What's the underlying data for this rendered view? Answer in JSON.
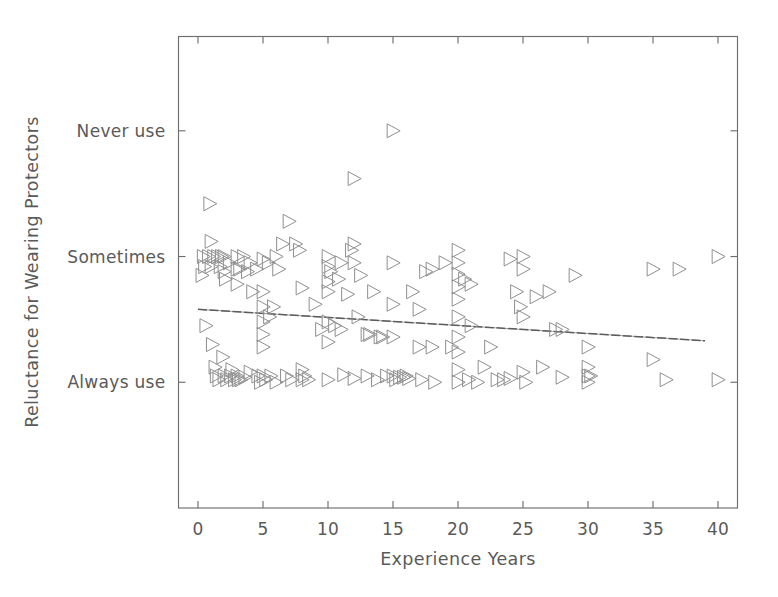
{
  "chart_data": {
    "type": "scatter",
    "title": "",
    "xlabel": "Experience Years",
    "ylabel": "Reluctance for Wearing Protectors",
    "xlim": [
      -1.5,
      41.5
    ],
    "ylim": [
      0.0,
      3.75
    ],
    "grid": false,
    "legend": null,
    "marker_style": "open right-pointing triangle",
    "marker_color": "#8f8f8f",
    "xticks": [
      0,
      5,
      10,
      15,
      20,
      25,
      30,
      35,
      40
    ],
    "xticklabels": [
      "0",
      "5",
      "10",
      "15",
      "20",
      "25",
      "30",
      "35",
      "40"
    ],
    "yticks": [
      1,
      2,
      3
    ],
    "yticklabels": [
      "Always use",
      "Sometimes",
      "Never use"
    ],
    "annotations": [
      {
        "type": "regression-line",
        "style": "dashed gray",
        "x_start": 0,
        "x_end": 39,
        "y_start": 1.58,
        "y_end": 1.33,
        "slope": -0.0064,
        "intercept": 1.58
      }
    ],
    "points": [
      {
        "x": 0.3,
        "y": 1.85
      },
      {
        "x": 0.4,
        "y": 2.0
      },
      {
        "x": 0.5,
        "y": 1.92
      },
      {
        "x": 0.6,
        "y": 1.45
      },
      {
        "x": 0.8,
        "y": 2.0
      },
      {
        "x": 0.9,
        "y": 2.42
      },
      {
        "x": 1.0,
        "y": 2.12
      },
      {
        "x": 1.0,
        "y": 1.92
      },
      {
        "x": 1.1,
        "y": 1.3
      },
      {
        "x": 1.2,
        "y": 2.0
      },
      {
        "x": 1.3,
        "y": 1.12
      },
      {
        "x": 1.4,
        "y": 1.05
      },
      {
        "x": 1.5,
        "y": 2.0
      },
      {
        "x": 1.6,
        "y": 1.02
      },
      {
        "x": 1.7,
        "y": 1.92
      },
      {
        "x": 1.8,
        "y": 2.0
      },
      {
        "x": 1.9,
        "y": 1.2
      },
      {
        "x": 2.0,
        "y": 2.0
      },
      {
        "x": 2.0,
        "y": 1.88
      },
      {
        "x": 2.0,
        "y": 1.05
      },
      {
        "x": 2.1,
        "y": 1.82
      },
      {
        "x": 2.2,
        "y": 1.02
      },
      {
        "x": 2.4,
        "y": 1.95
      },
      {
        "x": 2.5,
        "y": 1.05
      },
      {
        "x": 2.6,
        "y": 1.1
      },
      {
        "x": 2.8,
        "y": 1.02
      },
      {
        "x": 3.0,
        "y": 2.0
      },
      {
        "x": 3.0,
        "y": 1.9
      },
      {
        "x": 3.0,
        "y": 1.78
      },
      {
        "x": 3.0,
        "y": 1.05
      },
      {
        "x": 3.1,
        "y": 1.02
      },
      {
        "x": 3.2,
        "y": 1.9
      },
      {
        "x": 3.3,
        "y": 1.02
      },
      {
        "x": 3.5,
        "y": 2.0
      },
      {
        "x": 3.6,
        "y": 1.04
      },
      {
        "x": 3.8,
        "y": 1.88
      },
      {
        "x": 4.0,
        "y": 1.95
      },
      {
        "x": 4.0,
        "y": 1.08
      },
      {
        "x": 4.2,
        "y": 1.72
      },
      {
        "x": 4.5,
        "y": 1.9
      },
      {
        "x": 4.6,
        "y": 1.05
      },
      {
        "x": 4.8,
        "y": 1.0
      },
      {
        "x": 5.0,
        "y": 1.98
      },
      {
        "x": 5.0,
        "y": 1.72
      },
      {
        "x": 5.0,
        "y": 1.6
      },
      {
        "x": 5.0,
        "y": 1.48
      },
      {
        "x": 5.0,
        "y": 1.38
      },
      {
        "x": 5.0,
        "y": 1.28
      },
      {
        "x": 5.0,
        "y": 1.05
      },
      {
        "x": 5.2,
        "y": 1.02
      },
      {
        "x": 5.4,
        "y": 1.95
      },
      {
        "x": 5.5,
        "y": 1.52
      },
      {
        "x": 5.6,
        "y": 1.05
      },
      {
        "x": 5.8,
        "y": 1.6
      },
      {
        "x": 6.0,
        "y": 2.0
      },
      {
        "x": 6.0,
        "y": 1.0
      },
      {
        "x": 6.2,
        "y": 1.9
      },
      {
        "x": 6.5,
        "y": 2.1
      },
      {
        "x": 6.8,
        "y": 1.05
      },
      {
        "x": 7.0,
        "y": 2.28
      },
      {
        "x": 7.2,
        "y": 1.02
      },
      {
        "x": 7.5,
        "y": 2.1
      },
      {
        "x": 7.8,
        "y": 2.05
      },
      {
        "x": 8.0,
        "y": 1.75
      },
      {
        "x": 8.0,
        "y": 1.1
      },
      {
        "x": 8.0,
        "y": 1.02
      },
      {
        "x": 8.2,
        "y": 1.05
      },
      {
        "x": 8.5,
        "y": 1.02
      },
      {
        "x": 9.0,
        "y": 1.62
      },
      {
        "x": 9.5,
        "y": 1.42
      },
      {
        "x": 10.0,
        "y": 2.0
      },
      {
        "x": 10.0,
        "y": 1.92
      },
      {
        "x": 10.0,
        "y": 1.8
      },
      {
        "x": 10.0,
        "y": 1.72
      },
      {
        "x": 10.0,
        "y": 1.48
      },
      {
        "x": 10.0,
        "y": 1.32
      },
      {
        "x": 10.0,
        "y": 1.02
      },
      {
        "x": 10.2,
        "y": 1.88
      },
      {
        "x": 10.5,
        "y": 1.45
      },
      {
        "x": 10.8,
        "y": 1.82
      },
      {
        "x": 11.0,
        "y": 1.95
      },
      {
        "x": 11.0,
        "y": 1.42
      },
      {
        "x": 11.2,
        "y": 1.06
      },
      {
        "x": 11.5,
        "y": 1.7
      },
      {
        "x": 11.8,
        "y": 2.05
      },
      {
        "x": 12.0,
        "y": 2.62
      },
      {
        "x": 12.0,
        "y": 2.1
      },
      {
        "x": 12.0,
        "y": 1.95
      },
      {
        "x": 12.0,
        "y": 1.03
      },
      {
        "x": 12.3,
        "y": 1.52
      },
      {
        "x": 12.5,
        "y": 1.85
      },
      {
        "x": 13.0,
        "y": 1.38
      },
      {
        "x": 13.0,
        "y": 1.05
      },
      {
        "x": 13.2,
        "y": 1.38
      },
      {
        "x": 13.5,
        "y": 1.72
      },
      {
        "x": 13.8,
        "y": 1.02
      },
      {
        "x": 14.0,
        "y": 1.36
      },
      {
        "x": 14.2,
        "y": 1.36
      },
      {
        "x": 14.5,
        "y": 1.05
      },
      {
        "x": 15.0,
        "y": 3.0
      },
      {
        "x": 15.0,
        "y": 1.95
      },
      {
        "x": 15.0,
        "y": 1.62
      },
      {
        "x": 15.0,
        "y": 1.36
      },
      {
        "x": 15.0,
        "y": 1.05
      },
      {
        "x": 15.2,
        "y": 1.02
      },
      {
        "x": 15.5,
        "y": 1.04
      },
      {
        "x": 15.8,
        "y": 1.04
      },
      {
        "x": 16.0,
        "y": 1.05
      },
      {
        "x": 16.2,
        "y": 1.03
      },
      {
        "x": 16.5,
        "y": 1.72
      },
      {
        "x": 17.0,
        "y": 1.58
      },
      {
        "x": 17.0,
        "y": 1.28
      },
      {
        "x": 17.2,
        "y": 1.02
      },
      {
        "x": 17.5,
        "y": 1.88
      },
      {
        "x": 18.0,
        "y": 1.9
      },
      {
        "x": 18.0,
        "y": 1.28
      },
      {
        "x": 18.2,
        "y": 1.0
      },
      {
        "x": 19.0,
        "y": 1.95
      },
      {
        "x": 19.5,
        "y": 1.28
      },
      {
        "x": 20.0,
        "y": 2.05
      },
      {
        "x": 20.0,
        "y": 1.95
      },
      {
        "x": 20.0,
        "y": 1.86
      },
      {
        "x": 20.0,
        "y": 1.76
      },
      {
        "x": 20.0,
        "y": 1.66
      },
      {
        "x": 20.0,
        "y": 1.52
      },
      {
        "x": 20.0,
        "y": 1.36
      },
      {
        "x": 20.0,
        "y": 1.24
      },
      {
        "x": 20.0,
        "y": 1.1
      },
      {
        "x": 20.0,
        "y": 1.0
      },
      {
        "x": 20.5,
        "y": 1.82
      },
      {
        "x": 20.8,
        "y": 1.02
      },
      {
        "x": 21.0,
        "y": 1.78
      },
      {
        "x": 21.0,
        "y": 1.45
      },
      {
        "x": 21.5,
        "y": 1.0
      },
      {
        "x": 22.0,
        "y": 1.12
      },
      {
        "x": 22.5,
        "y": 1.28
      },
      {
        "x": 23.0,
        "y": 1.02
      },
      {
        "x": 23.5,
        "y": 1.02
      },
      {
        "x": 24.0,
        "y": 1.98
      },
      {
        "x": 24.0,
        "y": 1.03
      },
      {
        "x": 24.5,
        "y": 1.72
      },
      {
        "x": 24.8,
        "y": 1.6
      },
      {
        "x": 25.0,
        "y": 2.0
      },
      {
        "x": 25.0,
        "y": 1.9
      },
      {
        "x": 25.0,
        "y": 1.52
      },
      {
        "x": 25.0,
        "y": 1.08
      },
      {
        "x": 25.2,
        "y": 1.0
      },
      {
        "x": 26.0,
        "y": 1.68
      },
      {
        "x": 26.5,
        "y": 1.12
      },
      {
        "x": 27.0,
        "y": 1.72
      },
      {
        "x": 27.5,
        "y": 1.42
      },
      {
        "x": 28.0,
        "y": 1.42
      },
      {
        "x": 28.0,
        "y": 1.04
      },
      {
        "x": 29.0,
        "y": 1.85
      },
      {
        "x": 30.0,
        "y": 1.28
      },
      {
        "x": 30.0,
        "y": 1.12
      },
      {
        "x": 30.0,
        "y": 1.05
      },
      {
        "x": 30.0,
        "y": 1.0
      },
      {
        "x": 30.2,
        "y": 1.05
      },
      {
        "x": 35.0,
        "y": 1.9
      },
      {
        "x": 35.0,
        "y": 1.18
      },
      {
        "x": 36.0,
        "y": 1.02
      },
      {
        "x": 37.0,
        "y": 1.9
      },
      {
        "x": 40.0,
        "y": 2.0
      },
      {
        "x": 40.0,
        "y": 1.02
      }
    ]
  },
  "axis": {
    "x_title": "Experience Years",
    "y_title": "Reluctance for Wearing Protectors",
    "x_ticks": [
      "0",
      "5",
      "10",
      "15",
      "20",
      "25",
      "30",
      "35",
      "40"
    ],
    "y_ticks": [
      "Never use",
      "Sometimes",
      "Always use"
    ]
  }
}
